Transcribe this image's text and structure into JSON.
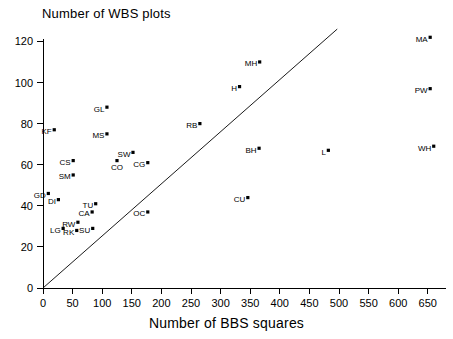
{
  "chart_data": {
    "type": "scatter",
    "title": "Number of WBS plots",
    "xlabel": "Number of BBS squares",
    "ylabel": "",
    "xlim": [
      0,
      670
    ],
    "ylim": [
      0,
      128
    ],
    "xticks": [
      0,
      50,
      100,
      150,
      200,
      250,
      300,
      350,
      400,
      450,
      500,
      550,
      600,
      650
    ],
    "yticks": [
      0,
      20,
      40,
      60,
      80,
      100,
      120
    ],
    "grid": false,
    "legend": "none",
    "annotations": [
      {
        "name": "identity-reference-line",
        "type": "line",
        "x": [
          0,
          497
        ],
        "y": [
          0,
          126
        ]
      }
    ],
    "points": [
      {
        "label": "KF",
        "x": 19,
        "y": 77,
        "label_pos": "left"
      },
      {
        "label": "GL",
        "x": 108,
        "y": 88,
        "label_pos": "left"
      },
      {
        "label": "MS",
        "x": 108,
        "y": 75,
        "label_pos": "left"
      },
      {
        "label": "CS",
        "x": 51,
        "y": 62,
        "label_pos": "left"
      },
      {
        "label": "SM",
        "x": 51,
        "y": 55,
        "label_pos": "left"
      },
      {
        "label": "GD",
        "x": 9,
        "y": 46,
        "label_pos": "left"
      },
      {
        "label": "DI",
        "x": 26,
        "y": 43,
        "label_pos": "left"
      },
      {
        "label": "CO",
        "x": 125,
        "y": 62,
        "label_pos": "below"
      },
      {
        "label": "SW",
        "x": 152,
        "y": 66,
        "label_pos": "left"
      },
      {
        "label": "CG",
        "x": 177,
        "y": 61,
        "label_pos": "left"
      },
      {
        "label": "TU",
        "x": 89,
        "y": 41,
        "label_pos": "left"
      },
      {
        "label": "CA",
        "x": 83,
        "y": 37,
        "label_pos": "left"
      },
      {
        "label": "RW",
        "x": 59,
        "y": 32,
        "label_pos": "left"
      },
      {
        "label": "LG",
        "x": 34,
        "y": 29,
        "label_pos": "left"
      },
      {
        "label": "RK",
        "x": 57,
        "y": 28,
        "label_pos": "left"
      },
      {
        "label": "SU",
        "x": 84,
        "y": 29,
        "label_pos": "left"
      },
      {
        "label": "OC",
        "x": 177,
        "y": 37,
        "label_pos": "left"
      },
      {
        "label": "RB",
        "x": 265,
        "y": 80,
        "label_pos": "left"
      },
      {
        "label": "MH",
        "x": 366,
        "y": 110,
        "label_pos": "left"
      },
      {
        "label": "H",
        "x": 332,
        "y": 98,
        "label_pos": "left"
      },
      {
        "label": "BH",
        "x": 365,
        "y": 68,
        "label_pos": "left"
      },
      {
        "label": "CU",
        "x": 346,
        "y": 44,
        "label_pos": "left"
      },
      {
        "label": "L",
        "x": 482,
        "y": 67,
        "label_pos": "left"
      },
      {
        "label": "MA",
        "x": 654,
        "y": 122,
        "label_pos": "left"
      },
      {
        "label": "PW",
        "x": 654,
        "y": 97,
        "label_pos": "left"
      },
      {
        "label": "WH",
        "x": 660,
        "y": 69,
        "label_pos": "left"
      }
    ]
  },
  "colors": {
    "axis": "#000000",
    "marker": "#000000",
    "reference_line": "#000000",
    "background": "#ffffff"
  }
}
